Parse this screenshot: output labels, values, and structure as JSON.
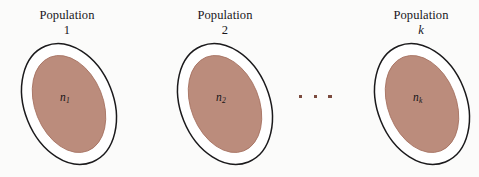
{
  "figure": {
    "background_color": "#fbfbfa",
    "outline_color": "#1b1a1c",
    "fill_color": "#bb8c7c",
    "dot_color": "#7b4b3e",
    "groups": [
      {
        "label_line1": "Population",
        "label_line2": "1",
        "label_line2_italic": false,
        "sample_label": "n",
        "sample_subscript": "1",
        "x": 10,
        "label_left": 12,
        "label_top": 8,
        "label_width": 110
      },
      {
        "label_line1": "Population",
        "label_line2": "2",
        "label_line2_italic": false,
        "sample_label": "n",
        "sample_subscript": "2",
        "x": 168,
        "label_left": 170,
        "label_top": 8,
        "label_width": 110
      },
      {
        "label_line1": "Population",
        "label_line2": "k",
        "label_line2_italic": true,
        "sample_label": "n",
        "sample_subscript": "k",
        "x": 362,
        "label_left": 366,
        "label_top": 8,
        "label_width": 110
      }
    ],
    "ellipsis": {
      "name": "continuation-dots",
      "dot_count": 3,
      "left": 299,
      "top": 95
    }
  }
}
